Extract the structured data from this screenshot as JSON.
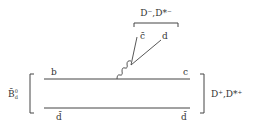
{
  "diagram": {
    "type": "feynman",
    "initial_meson": {
      "label": "B̄",
      "sup": "0",
      "sub": "d"
    },
    "final_meson_right": {
      "label": "D⁺,D*⁺"
    },
    "final_meson_top": {
      "label": "D⁻,D*⁻"
    },
    "quarks": {
      "top_left": "b",
      "top_right": "c",
      "bottom_left": "d̄",
      "bottom_right": "d̄",
      "emitted_1": "c̄",
      "emitted_2": "d"
    },
    "colors": {
      "line": "#444444",
      "text": "#333333"
    }
  }
}
